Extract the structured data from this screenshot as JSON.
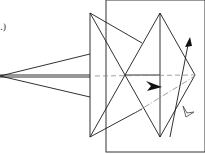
{
  "diagram": {
    "type": "origami-fold-diagram",
    "caption_fragment": ".)",
    "colors": {
      "line": "#1a1a1a",
      "dashed": "#888888",
      "frame": "#333333",
      "background": "#ffffff",
      "arrow_filled": "#111111",
      "arrow_hollow": "#ffffff"
    },
    "elements": {
      "frame": "rectangle-frame",
      "left_spike": "narrow-kite-point",
      "star": "diamond-with-crossed-triangles",
      "valley_fold_line": "dashed-horizontal",
      "diagonal_fold_line": "dash-dot-diagonal",
      "fold_arrow": "arrow-up-right",
      "push_arrow": "filled-arrowhead",
      "hollow_arrow": "hollow-arrowhead"
    }
  }
}
